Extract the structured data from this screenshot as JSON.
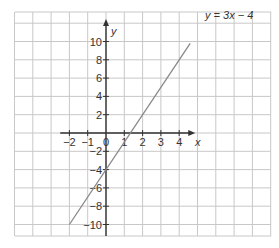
{
  "header": {
    "partial_text": "graph"
  },
  "chart_data": {
    "type": "line",
    "title": "",
    "xlabel": "x",
    "ylabel": "y",
    "xlim": [
      -5,
      9
    ],
    "ylim": [
      -12,
      12
    ],
    "grid": true,
    "x_ticks": [
      -2,
      -1,
      0,
      1,
      2,
      3,
      4
    ],
    "x_tick_labels": [
      "−2",
      "−1",
      "0",
      "1",
      "2",
      "3",
      "4"
    ],
    "y_ticks": [
      10,
      8,
      6,
      4,
      2,
      -2,
      -4,
      -6,
      -8,
      -10
    ],
    "y_tick_labels": [
      "10",
      "8",
      "6",
      "4",
      "2",
      "−2",
      "−4",
      "−6",
      "−8",
      "−10"
    ],
    "series": [
      {
        "name": "y = 3x − 4",
        "equation": "y = 3x - 4",
        "x": [
          -2,
          4
        ],
        "y": [
          -10,
          8
        ],
        "color": "#888888"
      }
    ],
    "annotations": [
      {
        "text": "y = 3x − 4",
        "x": 4,
        "y": 10
      }
    ],
    "axis_color": "#333333",
    "grid_color": "#c8c8c8"
  }
}
